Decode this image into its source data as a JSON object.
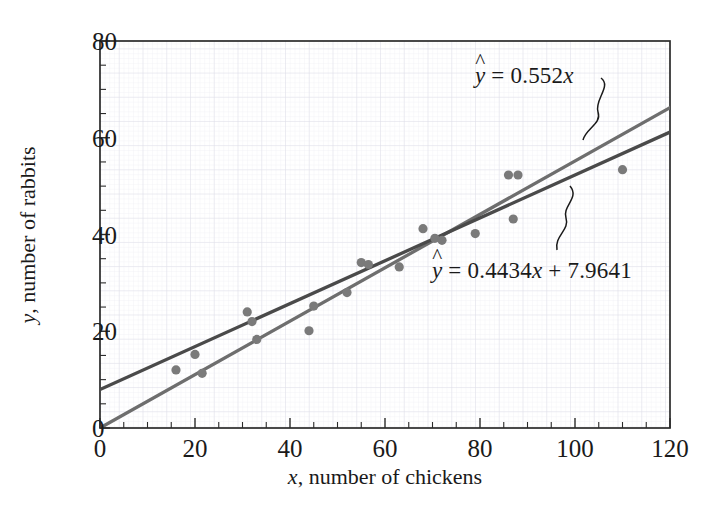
{
  "chart_data": {
    "type": "scatter",
    "title": "",
    "xlabel": "x, number of chickens",
    "ylabel": "y, number of rabbits",
    "xlim": [
      0,
      120
    ],
    "ylim": [
      0,
      80
    ],
    "xticks": [
      0,
      20,
      40,
      60,
      80,
      100,
      120
    ],
    "yticks": [
      0,
      20,
      40,
      60,
      80
    ],
    "xtick_labels": [
      "0",
      "20",
      "40",
      "60",
      "80",
      "100",
      "120"
    ],
    "ytick_labels": [
      "0",
      "20",
      "40",
      "60",
      "80"
    ],
    "x_minor_tick_step": 5,
    "y_minor_tick_step": 5,
    "grid": true,
    "grid_color": "#e8e8ee",
    "legend": "none",
    "point_color": "#7a7a7a",
    "point_radius": 4.6,
    "points": [
      {
        "x": 16,
        "y": 12.0
      },
      {
        "x": 20,
        "y": 15.2
      },
      {
        "x": 21.5,
        "y": 11.3
      },
      {
        "x": 31,
        "y": 24.0
      },
      {
        "x": 32,
        "y": 22.0
      },
      {
        "x": 33,
        "y": 18.3
      },
      {
        "x": 44,
        "y": 20.1
      },
      {
        "x": 45,
        "y": 25.2
      },
      {
        "x": 52,
        "y": 28.0
      },
      {
        "x": 55,
        "y": 34.2
      },
      {
        "x": 56.5,
        "y": 33.8
      },
      {
        "x": 63,
        "y": 33.3
      },
      {
        "x": 68,
        "y": 41.2
      },
      {
        "x": 70.5,
        "y": 39.2
      },
      {
        "x": 72,
        "y": 38.8
      },
      {
        "x": 79,
        "y": 40.2
      },
      {
        "x": 86,
        "y": 52.3
      },
      {
        "x": 88,
        "y": 52.3
      },
      {
        "x": 87,
        "y": 43.2
      },
      {
        "x": 110,
        "y": 53.4
      }
    ],
    "lines": [
      {
        "name": "through-origin-fit",
        "equation": "ŷ = 0.552x",
        "slope": 0.552,
        "intercept": 0,
        "color": "#6e6e6e",
        "label_parts": {
          "lhs": "y",
          "rhs_num": " = 0.552",
          "rhs_var": "x"
        }
      },
      {
        "name": "least-squares-fit",
        "equation": "ŷ = 0.4434x + 7.9641",
        "slope": 0.4434,
        "intercept": 7.9641,
        "color": "#4a4a4a",
        "label_parts": {
          "lhs": "y",
          "rhs_num": " = 0.4434",
          "rhs_var": "x",
          "rhs_tail": " + 7.9641"
        }
      }
    ],
    "annotations": [
      {
        "name": "leader-curve-upper",
        "points_to": "through-origin-fit"
      },
      {
        "name": "leader-curve-lower",
        "points_to": "least-squares-fit"
      }
    ]
  },
  "axes": {
    "x_title_var": "x",
    "x_title_rest": ", number of chickens",
    "y_title_var": "y",
    "y_title_rest": ", number of rabbits"
  },
  "equations": {
    "upper": {
      "hat_var": "y",
      "body": " = 0.552",
      "tail_var": "x",
      "tail_rest": ""
    },
    "lower": {
      "hat_var": "y",
      "body": " = 0.4434",
      "tail_var": "x",
      "tail_rest": " + 7.9641"
    }
  }
}
